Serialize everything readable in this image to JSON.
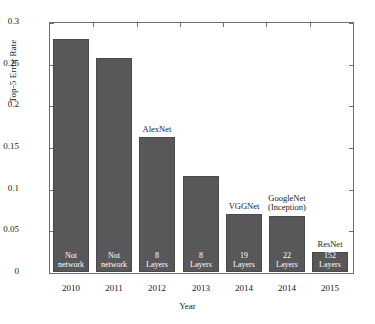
{
  "chart_data": {
    "type": "bar",
    "title": "",
    "xlabel": "Year",
    "ylabel": "Top-5 Error Rate",
    "ylim": [
      0,
      0.3
    ],
    "yticks": [
      "0",
      "0.05",
      "0.1",
      "0.15",
      "0.2",
      "0.25",
      "0.3"
    ],
    "ytick_values": [
      0,
      0.05,
      0.1,
      0.15,
      0.2,
      0.25,
      0.3
    ],
    "grid": false,
    "legend": "none",
    "categories": [
      "2010",
      "2011",
      "2012",
      "2013",
      "2014",
      "2014",
      "2015"
    ],
    "values": [
      0.28,
      0.257,
      0.162,
      0.115,
      0.07,
      0.067,
      0.0236
    ],
    "bars": [
      {
        "year": "2010",
        "value": 0.28,
        "inner_label": "Not\nnetwork",
        "above_label": ""
      },
      {
        "year": "2011",
        "value": 0.257,
        "inner_label": "Not\nnetwork",
        "above_label": ""
      },
      {
        "year": "2012",
        "value": 0.162,
        "inner_label": "8\nLayers",
        "above_label": "AlexNet"
      },
      {
        "year": "2013",
        "value": 0.115,
        "inner_label": "8\nLayers",
        "above_label": ""
      },
      {
        "year": "2014",
        "value": 0.07,
        "inner_label": "19\nLayers",
        "above_label": "VGGNet"
      },
      {
        "year": "2014",
        "value": 0.067,
        "inner_label": "22\nLayers",
        "above_label": "GoogleNet\n(Inception)"
      },
      {
        "year": "2015",
        "value": 0.0236,
        "inner_label": "152\nLayers",
        "above_label": "ResNet"
      }
    ],
    "colors": {
      "bar_fill": "#58585a",
      "bar_edge": "#4a4a4c",
      "axis": "#6f6f6f",
      "text": "#1a1a1a",
      "background": "#ffffff"
    }
  }
}
